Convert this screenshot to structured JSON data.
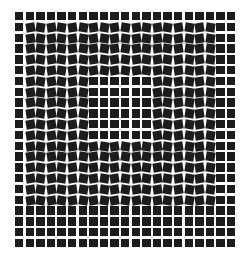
{
  "illusion": {
    "title": "",
    "background": "#ffffff",
    "square_color": "#1c1c1c",
    "grid": {
      "cols": 21,
      "rows": 22,
      "origin_x": 15,
      "origin_y": 12,
      "pitch_x": 10.6,
      "pitch_y": 10.8,
      "square_size": 8.4
    },
    "tilted_region": {
      "col_start": 1,
      "col_end": 18,
      "row_start": 1,
      "row_end": 17
    },
    "untilted_inner_region": {
      "col_start": 7,
      "col_end": 12,
      "row_start": 6,
      "row_end": 11
    },
    "tilt_degrees": 9,
    "tilt_pattern": "alternate-by-column"
  }
}
